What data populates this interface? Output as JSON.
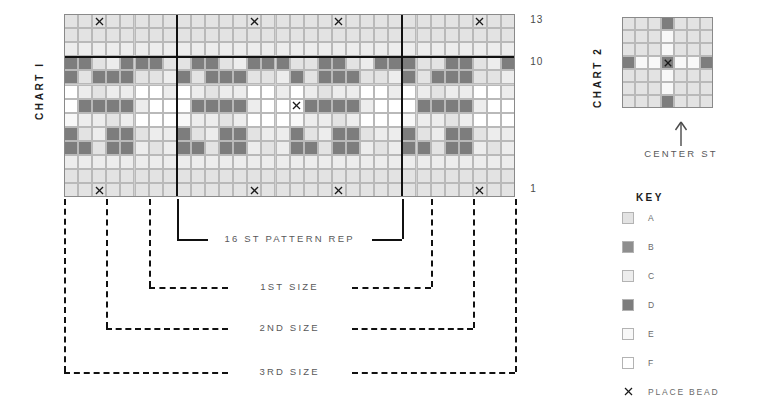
{
  "chart1": {
    "title": "CHART I",
    "cols": 32,
    "rows": 13,
    "cell": 14.1,
    "row_labels": [
      {
        "text": "13",
        "row": 13
      },
      {
        "text": "10",
        "row": 10
      },
      {
        "text": "1",
        "row": 1
      }
    ],
    "palette": {
      "A": "#e3e3e3",
      "B": "#8e8e8e",
      "C": "#ededed",
      "D": "#7d7d7d",
      "E": "#f8f8f8",
      "F": "#ffffff"
    },
    "rep_bold_cols": [
      8,
      24
    ],
    "grid": [
      "AAAAAAAAAAAAAAAAAAAAAAAAAAAAAAAA",
      "AAAAAAAAAAAAAAAAAAAAAAAAAAAAAAAA",
      "CCCCCCCCCCCCCCCCCCCCCCCCCCCCCCCC",
      "DDACDDDAADDACDDDAADDACDDDAADDACD",
      "DADDDAACDADDDAACDADDDAACDADDDAAC",
      "FCACCFFCFCACCFFCFCACCFFCFCACCFFC",
      "FDDDDCFFFDDDDCFFFDDDDCFFFDDDDCFF",
      "ECCACFFFECCACFFFECCACFFFECCACFFF",
      "DACDDACCDACDDACCDACDDACCDACDDACC",
      "DDADDCACDDADDCACDDADDCACDDADDCAC",
      "CCCCCCCCCCCCCCCCCCCCCCCCCCCCCCCC",
      "AAAAAAAAAAAAAAAAAAAAAAAAAAAAAAAA",
      "AAAAAAAAAAAAAAAAAAAAAAAAAAAAAAAA"
    ],
    "bead_cells": [
      {
        "row": 13,
        "col": 3
      },
      {
        "row": 13,
        "col": 14
      },
      {
        "row": 13,
        "col": 20
      },
      {
        "row": 13,
        "col": 30
      },
      {
        "row": 7,
        "col": 17
      },
      {
        "row": 1,
        "col": 3
      },
      {
        "row": 1,
        "col": 14
      },
      {
        "row": 1,
        "col": 20
      },
      {
        "row": 1,
        "col": 30
      }
    ]
  },
  "chart2": {
    "title": "CHART 2",
    "cols": 7,
    "rows": 7,
    "cell": 13.0,
    "grid": [
      "AAADAAA",
      "AAAEAAA",
      "AAAEAAA",
      "DEEDEED",
      "AAAEAAA",
      "AAAEAAA",
      "AAADAAA"
    ],
    "bead_cells": [
      {
        "row": 4,
        "col": 4
      }
    ],
    "center_label": "CENTER ST"
  },
  "brackets": {
    "rep": {
      "label": "16 ST PATTERN REP"
    },
    "size1": {
      "label": "1ST SIZE"
    },
    "size2": {
      "label": "2ND SIZE"
    },
    "size3": {
      "label": "3RD SIZE"
    }
  },
  "key": {
    "title": "KEY",
    "items": [
      {
        "label": "A",
        "color": "#e3e3e3",
        "icon": "swatch"
      },
      {
        "label": "B",
        "color": "#8e8e8e",
        "icon": "swatch"
      },
      {
        "label": "C",
        "color": "#ededed",
        "icon": "swatch"
      },
      {
        "label": "D",
        "color": "#7d7d7d",
        "icon": "swatch"
      },
      {
        "label": "E",
        "color": "#f8f8f8",
        "icon": "swatch"
      },
      {
        "label": "F",
        "color": "#ffffff",
        "icon": "swatch"
      },
      {
        "label": "PLACE BEAD",
        "color": "",
        "icon": "bead-x"
      }
    ]
  }
}
